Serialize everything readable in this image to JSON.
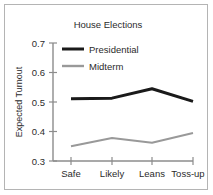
{
  "chart_data": {
    "type": "line",
    "title": "House Elections",
    "xlabel": "",
    "ylabel": "Expected Turnout",
    "categories": [
      "Safe",
      "Likely",
      "Leans",
      "Toss-up"
    ],
    "series": [
      {
        "name": "Presidential",
        "values": [
          0.511,
          0.513,
          0.545,
          0.502
        ],
        "color": "#1a1a1a",
        "line_width": 3
      },
      {
        "name": "Midterm",
        "values": [
          0.35,
          0.378,
          0.362,
          0.395
        ],
        "color": "#999999",
        "line_width": 2
      }
    ],
    "ylim": [
      0.3,
      0.7
    ],
    "ytick_labels": [
      "0.7",
      "0.6",
      "0.5",
      "0.4",
      "0.3"
    ],
    "ytick_values": [
      0.7,
      0.6,
      0.5,
      0.4,
      0.3
    ],
    "grid": false,
    "legend_position": "upper-left-inside",
    "axis_color": "#8c8c8c",
    "text_color": "#2b2b2b",
    "background": "#ffffff",
    "border_color": "#b4b4b4"
  },
  "legend": {
    "entries": [
      {
        "label": "Presidential"
      },
      {
        "label": "Midterm"
      }
    ]
  },
  "axes": {
    "y_tick_0": "0.7",
    "y_tick_1": "0.6",
    "y_tick_2": "0.5",
    "y_tick_3": "0.4",
    "y_tick_4": "0.3",
    "x_tick_0": "Safe",
    "x_tick_1": "Likely",
    "x_tick_2": "Leans",
    "x_tick_3": "Toss-up",
    "y_axis_title": "Expected Turnout"
  },
  "header": {
    "title": "House Elections"
  }
}
